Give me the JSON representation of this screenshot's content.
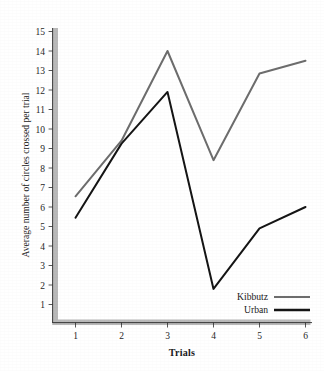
{
  "chart_data": {
    "type": "line",
    "title": "",
    "xlabel": "Trials",
    "ylabel": "Average number of circles crossed per trial",
    "x": [
      1,
      2,
      3,
      4,
      5,
      6
    ],
    "xtick_labels": [
      "1",
      "2",
      "3",
      "4",
      "5",
      "6"
    ],
    "ytick_labels": [
      "1",
      "2",
      "3",
      "4",
      "5",
      "6",
      "7",
      "8",
      "9",
      "10",
      "11",
      "12",
      "13",
      "14",
      "15"
    ],
    "ylim": [
      0,
      15
    ],
    "xlim": [
      0.5,
      6.5
    ],
    "grid": false,
    "legend_position": "bottom-right",
    "series": [
      {
        "name": "Kibbutz",
        "color": "#6d6d6d",
        "values": [
          6.55,
          9.4,
          14.0,
          8.4,
          12.85,
          13.5
        ]
      },
      {
        "name": "Urban",
        "color": "#151515",
        "values": [
          5.45,
          9.25,
          11.9,
          1.8,
          4.9,
          6.0
        ]
      }
    ]
  },
  "axes": {
    "x_title": "Trials",
    "y_title": "Average number of circles crossed per trial"
  },
  "legend": {
    "items": [
      {
        "label": "Kibbutz",
        "color": "#6d6d6d"
      },
      {
        "label": "Urban",
        "color": "#151515"
      }
    ]
  },
  "colors": {
    "kibbutz_line": "#6d6d6d",
    "urban_line": "#151515",
    "axis_line": "#2b2b2b",
    "axis_shadow": "#b5b5b5",
    "background": "#ffffff"
  }
}
